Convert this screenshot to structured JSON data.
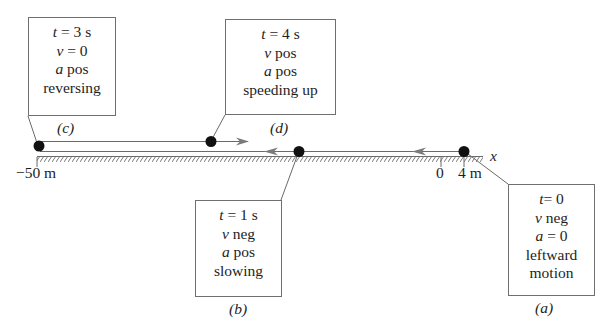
{
  "figure": {
    "axis": {
      "name": "x",
      "ticks": [
        {
          "label": "−50 m",
          "pos": -50
        },
        {
          "label": "0",
          "pos": 0
        },
        {
          "label": "4 m",
          "pos": 4
        }
      ]
    },
    "states": [
      {
        "id": "a",
        "tag": "(a)",
        "time": "t = 0",
        "t_var": "t",
        "t_val": "= 0",
        "v_var": "v",
        "v_val": " neg",
        "a_var": "a",
        "a_val": " = 0",
        "desc": [
          "leftward",
          "motion"
        ]
      },
      {
        "id": "b",
        "tag": "(b)",
        "time": "t = 1 s",
        "t_var": "t",
        "t_val": " = 1 s",
        "v_var": "v",
        "v_val": " neg",
        "a_var": "a",
        "a_val": " pos",
        "desc": [
          "slowing"
        ]
      },
      {
        "id": "c",
        "tag": "(c)",
        "time": "t = 3 s",
        "t_var": "t",
        "t_val": " = 3 s",
        "v_var": "v",
        "v_val": " = 0",
        "a_var": "a",
        "a_val": " pos",
        "desc": [
          "reversing"
        ]
      },
      {
        "id": "d",
        "tag": "(d)",
        "time": "t = 4 s",
        "t_var": "t",
        "t_val": " = 4 s",
        "v_var": "v",
        "v_val": " pos",
        "a_var": "a",
        "a_val": " pos",
        "desc": [
          "speeding up"
        ]
      }
    ],
    "colors": {
      "line": "#6a6a6a",
      "dot": "#111111",
      "box_border": "#6f6f6f",
      "text": "#1e1e1e"
    }
  }
}
